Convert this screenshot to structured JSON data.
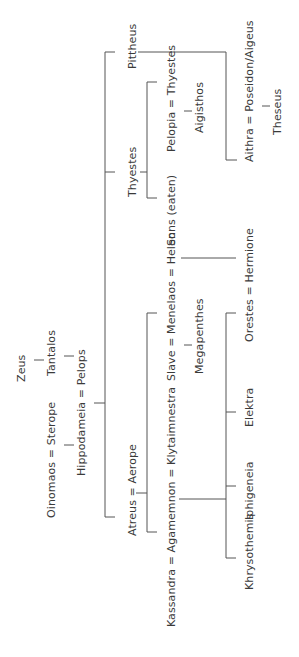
{
  "diagram": {
    "type": "family-tree",
    "orientation": "rotated-90-ccw",
    "nodes": {
      "zeus": "Zeus",
      "tantalos": "Tantalos",
      "oinomaos_sterope": "Oinomaos = Sterope",
      "hippodameia_pelops": "Hippodameia = Pelops",
      "pittheus": "Pittheus",
      "thyestes": "Thyestes",
      "atreus_aerope": "Atreus = Aerope",
      "pelopia_thyestes": "Pelopia = Thyestes",
      "aigisthos": "Aigisthos",
      "sons_eaten": "Sons (eaten)",
      "aithra": "Aithra = Poseidon/Aigeus",
      "theseus": "Theseus",
      "menelaos": "Slave = Menelaos = Helen",
      "megapenthes": "Megapenthes",
      "agamemnon": "Kassandra = Agamemnon = Klytaimnestra",
      "orestes_hermione": "Orestes = Hermione",
      "elektra": "Elektra",
      "iphigeneia": "Iphigeneia",
      "khrysothemis": "Khrysothemis"
    },
    "edges": [
      [
        "Zeus",
        "Tantalos"
      ],
      [
        "Tantalos",
        "Pelops"
      ],
      [
        "Oinomaos = Sterope",
        "Hippodameia"
      ],
      [
        "Hippodameia = Pelops",
        "Pittheus"
      ],
      [
        "Hippodameia = Pelops",
        "Thyestes"
      ],
      [
        "Hippodameia = Pelops",
        "Atreus"
      ],
      [
        "Thyestes",
        "Pelopia"
      ],
      [
        "Thyestes",
        "Sons (eaten)"
      ],
      [
        "Pelopia = Thyestes",
        "Aigisthos"
      ],
      [
        "Pittheus",
        "Aithra"
      ],
      [
        "Aithra = Poseidon/Aigeus",
        "Theseus"
      ],
      [
        "Atreus = Aerope",
        "Menelaos"
      ],
      [
        "Atreus = Aerope",
        "Agamemnon"
      ],
      [
        "Slave = Menelaos",
        "Megapenthes"
      ],
      [
        "Menelaos = Helen",
        "Hermione"
      ],
      [
        "Agamemnon = Klytaimnestra",
        "Orestes"
      ],
      [
        "Agamemnon = Klytaimnestra",
        "Elektra"
      ],
      [
        "Agamemnon = Klytaimnestra",
        "Iphigeneia"
      ],
      [
        "Agamemnon = Klytaimnestra",
        "Khrysothemis"
      ]
    ]
  }
}
